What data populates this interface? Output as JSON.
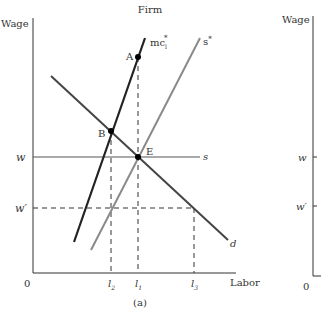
{
  "panel_a": {
    "title": "Firm",
    "y_axis_label": "Wage",
    "x_axis_label": "Labor",
    "origin_label": "0",
    "caption": "(a)",
    "wage_levels": {
      "w": "w",
      "w_prime": "w′"
    },
    "labor_levels": {
      "l2": "l",
      "l2_sub": "2",
      "l1": "l",
      "l1_sub": "1",
      "l3": "l",
      "l3_sub": "3"
    },
    "curves": {
      "mc": {
        "label": "mc",
        "sub": "l",
        "sup": "*"
      },
      "s_star": {
        "label": "s",
        "sup": "*"
      },
      "s": {
        "label": "s"
      },
      "d": {
        "label": "d"
      }
    },
    "points": {
      "A": "A",
      "B": "B",
      "E": "E"
    }
  },
  "panel_b": {
    "y_axis_label": "Wage",
    "origin_label": "0",
    "wage_levels": {
      "w": "w",
      "w_prime": "w′"
    }
  },
  "colors": {
    "mc": "#222222",
    "s_star": "#8a8a8a",
    "d": "#444444",
    "s": "#555555",
    "axis": "#333333"
  }
}
